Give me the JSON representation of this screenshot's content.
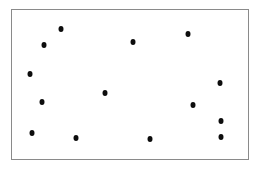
{
  "figure": {
    "background_color": "#ffffff",
    "frame_color": "#8a8a8a",
    "point_color": "#0d0d0d",
    "frame": {
      "left": 11,
      "top": 9,
      "width": 238,
      "height": 151
    }
  },
  "chart_data": {
    "type": "scatter",
    "title": "",
    "subtitle": "",
    "xlabel": "",
    "ylabel": "",
    "grid": false,
    "legend": null,
    "xlim": [
      0,
      100
    ],
    "ylim": [
      0,
      100
    ],
    "marker": {
      "shape": "circle",
      "color": "#0d0d0d",
      "size": 5
    },
    "n_points": 14,
    "series": [
      {
        "name": "points",
        "color": "#0d0d0d",
        "points": [
          {
            "x": 20.6,
            "y": 87.4
          },
          {
            "x": 13.4,
            "y": 76.2
          },
          {
            "x": 51.3,
            "y": 78.8
          },
          {
            "x": 74.4,
            "y": 84.1
          },
          {
            "x": 7.6,
            "y": 57.0
          },
          {
            "x": 88.2,
            "y": 51.0
          },
          {
            "x": 12.6,
            "y": 38.4
          },
          {
            "x": 39.5,
            "y": 44.4
          },
          {
            "x": 76.9,
            "y": 36.4
          },
          {
            "x": 8.4,
            "y": 17.2
          },
          {
            "x": 27.3,
            "y": 13.9
          },
          {
            "x": 58.4,
            "y": 13.2
          },
          {
            "x": 88.7,
            "y": 25.8
          },
          {
            "x": 88.7,
            "y": 14.6
          }
        ]
      }
    ]
  }
}
